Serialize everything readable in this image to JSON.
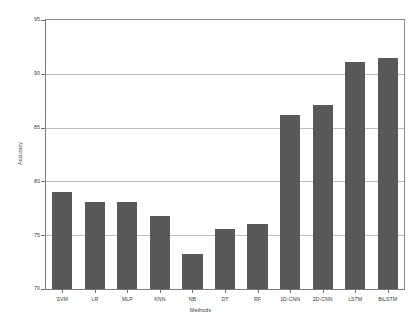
{
  "chart_data": {
    "type": "bar",
    "title": "",
    "xlabel": "Methods",
    "ylabel": "Accuracy",
    "categories": [
      "SVM",
      "LR",
      "MLP",
      "KNN",
      "NB",
      "DT",
      "RF",
      "1D-CNN",
      "2D-CNN",
      "LSTM",
      "BiLSTM"
    ],
    "values": [
      79.0,
      78.1,
      78.1,
      76.8,
      73.3,
      75.6,
      76.0,
      86.2,
      87.1,
      91.1,
      91.5
    ],
    "ylim": [
      70,
      95
    ],
    "yticks": [
      70,
      75,
      80,
      85,
      90,
      95
    ],
    "ytick_labels": [
      "70",
      "75",
      "80",
      "85",
      "90",
      "95"
    ],
    "grid": true,
    "grid_axis": "y",
    "legend": null,
    "bar_color": "#595959",
    "grid_color": "#bdbdbd",
    "axis_color": "#7a7a7a",
    "background_color": "#ffffff"
  }
}
